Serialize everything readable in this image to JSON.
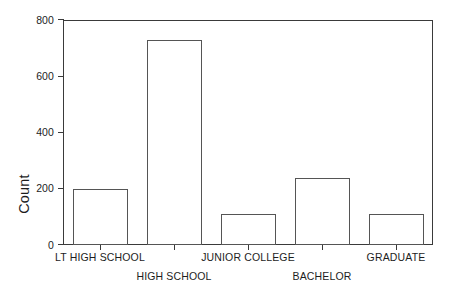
{
  "chart_data": {
    "type": "bar",
    "title": "",
    "subtitle": "",
    "xlabel": "",
    "ylabel": "Count",
    "categories": [
      "LT HIGH SCHOOL",
      "HIGH SCHOOL",
      "JUNIOR COLLEGE",
      "BACHELOR",
      "GRADUATE"
    ],
    "values": [
      200,
      730,
      110,
      240,
      110
    ],
    "ylim": [
      0,
      800
    ],
    "yticks": [
      0,
      200,
      400,
      600,
      800
    ],
    "ytick_labels": [
      "0",
      "200",
      "400",
      "600",
      "800"
    ],
    "grid": false,
    "legend": null,
    "legend_position": "none",
    "bar_fill": "#ffffff",
    "bar_edge": "#555555",
    "axis_color": "#3a3a3a",
    "background": "#ffffff",
    "label_rows": [
      {
        "row": 1,
        "labels": [
          "LT HIGH SCHOOL",
          "JUNIOR COLLEGE",
          "GRADUATE"
        ]
      },
      {
        "row": 2,
        "labels": [
          "HIGH SCHOOL",
          "BACHELOR"
        ]
      }
    ]
  },
  "axes": {
    "y_title": "Count"
  }
}
